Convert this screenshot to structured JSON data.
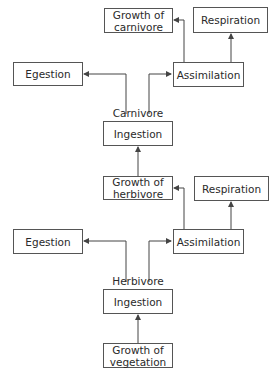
{
  "diagram": {
    "carnivore_level": {
      "label": "Carnivore",
      "growth": "Growth of\ncarnivore",
      "respiration": "Respiration",
      "egestion": "Egestion",
      "assimilation": "Assimilation",
      "ingestion": "Ingestion"
    },
    "herbivore_level": {
      "label": "Herbivore",
      "growth": "Growth of\nherbivore",
      "respiration": "Respiration",
      "egestion": "Egestion",
      "assimilation": "Assimilation",
      "ingestion": "Ingestion"
    },
    "base": {
      "growth_vegetation": "Growth of\nvegetation"
    },
    "colors": {
      "line": "#444444",
      "box_border": "#555555",
      "text": "#2a2a2a"
    }
  }
}
